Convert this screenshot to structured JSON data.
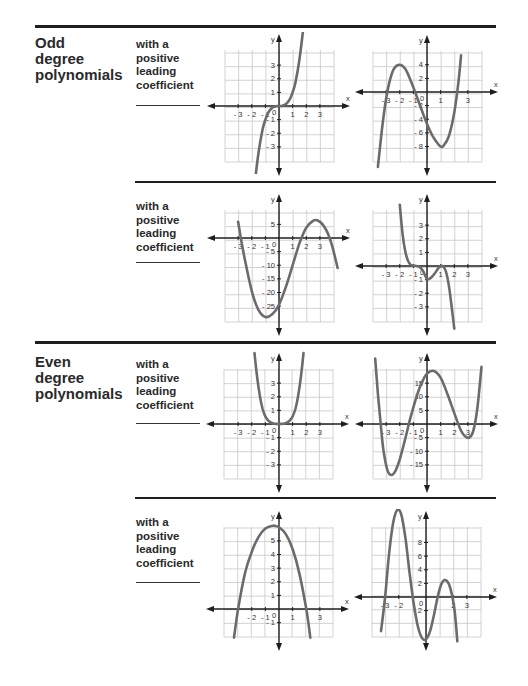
{
  "sections": [
    {
      "title_lines": [
        "Odd",
        "degree",
        "polynomials"
      ],
      "rows": [
        {
          "prompt_lines": [
            "with a",
            "positive",
            "leading",
            "coefficient"
          ],
          "answer_blank": ""
        },
        {
          "prompt_lines": [
            "with a",
            "positive",
            "leading",
            "coefficient"
          ],
          "answer_blank": ""
        }
      ]
    },
    {
      "title_lines": [
        "Even",
        "degree",
        "polynomials"
      ],
      "rows": [
        {
          "prompt_lines": [
            "with a",
            "positive",
            "leading",
            "coefficient"
          ],
          "answer_blank": ""
        },
        {
          "prompt_lines": [
            "with a",
            "positive",
            "leading",
            "coefficient"
          ],
          "answer_blank": ""
        }
      ]
    }
  ],
  "axis_labels": {
    "x": "x",
    "y": "y",
    "origin": "0"
  },
  "colors": {
    "curve": "#6b6b6b",
    "grid": "#c8c8c8",
    "axis": "#1e1e1e",
    "rule": "#1e1e1e"
  },
  "chart_data": [
    {
      "id": "odd-1",
      "type": "line",
      "section": "Odd degree polynomials",
      "title": "",
      "xlabel": "x",
      "ylabel": "y",
      "xlim": [
        -4,
        4
      ],
      "ylim": [
        -4,
        4
      ],
      "grid": true,
      "x_ticks": [
        -3,
        -2,
        -1,
        1,
        2,
        3
      ],
      "y_ticks": [
        3,
        2,
        1,
        -1,
        -2,
        -3
      ],
      "y_step": 1,
      "series": [
        {
          "name": "curve",
          "x": [
            -1.8,
            -1.5,
            -1.2,
            -1,
            -0.8,
            -0.5,
            -0.25,
            0,
            0.25,
            0.5,
            0.8,
            1,
            1.2,
            1.5,
            1.8
          ],
          "y": [
            -5.8,
            -3.4,
            -1.7,
            -1,
            -0.51,
            -0.13,
            -0.02,
            0,
            0.02,
            0.13,
            0.51,
            1,
            1.7,
            3.4,
            5.8
          ]
        }
      ]
    },
    {
      "id": "odd-2",
      "type": "line",
      "section": "Odd degree polynomials",
      "title": "",
      "xlabel": "x",
      "ylabel": "y",
      "xlim": [
        -4,
        4
      ],
      "ylim": [
        -10,
        6
      ],
      "grid": true,
      "x_ticks": [
        -3,
        -2,
        -1,
        1,
        3
      ],
      "y_ticks": [
        4,
        2,
        -2,
        -4,
        -6,
        -8
      ],
      "y_step": 2,
      "series": [
        {
          "name": "curve",
          "x": [
            -3.6,
            -3.3,
            -3,
            -2.7,
            -2.4,
            -2,
            -1.6,
            -1.2,
            -0.8,
            -0.4,
            0,
            0.4,
            0.8,
            1,
            1.2,
            1.6,
            2,
            2.3,
            2.5
          ],
          "y": [
            -11,
            -5.4,
            -1,
            1.9,
            3.5,
            4,
            3.4,
            1.7,
            -0.4,
            -2.6,
            -4.7,
            -6.4,
            -7.6,
            -8,
            -7.9,
            -6.5,
            -3,
            1.3,
            5.4
          ]
        }
      ]
    },
    {
      "id": "odd-3",
      "type": "line",
      "section": "Odd degree polynomials",
      "title": "",
      "xlabel": "x",
      "ylabel": "y",
      "xlim": [
        -4,
        4
      ],
      "ylim": [
        -32,
        8
      ],
      "grid": true,
      "x_ticks": [
        -3,
        -2,
        -1,
        1,
        2,
        3
      ],
      "y_ticks": [
        5,
        -5,
        -10,
        -15,
        -20,
        -25
      ],
      "y_step": 5,
      "series": [
        {
          "name": "curve",
          "x": [
            -3,
            -2.8,
            -2.5,
            -2,
            -1.5,
            -1,
            -0.5,
            0,
            0.5,
            1,
            1.5,
            2,
            2.5,
            2.8,
            3.2,
            3.6,
            3.9,
            4.3
          ],
          "y": [
            6,
            0,
            -8,
            -19.5,
            -26.5,
            -29,
            -28,
            -24.5,
            -18,
            -10,
            -2,
            3.8,
            6.3,
            6.5,
            5,
            1.5,
            -2.8,
            -11
          ]
        }
      ]
    },
    {
      "id": "odd-4",
      "type": "line",
      "section": "Odd degree polynomials",
      "title": "",
      "xlabel": "x",
      "ylabel": "y",
      "xlim": [
        -4,
        4
      ],
      "ylim": [
        -4,
        4
      ],
      "grid": true,
      "x_ticks": [
        -3,
        -2,
        -1,
        1,
        2,
        3
      ],
      "y_ticks": [
        3,
        2,
        1,
        -1,
        -2,
        -3
      ],
      "y_step": 1,
      "series": [
        {
          "name": "curve",
          "x": [
            -2,
            -1.8,
            -1.6,
            -1.4,
            -1.2,
            -1,
            -0.6,
            -0.3,
            0,
            0.3,
            0.6,
            0.8,
            1,
            1.2,
            1.4,
            1.6,
            1.8,
            2
          ],
          "y": [
            4.5,
            2.4,
            1.1,
            0.4,
            0.1,
            0.03,
            -0.05,
            -0.35,
            -0.95,
            -0.85,
            -0.5,
            -0.2,
            0,
            -0.05,
            -0.45,
            -1.4,
            -2.9,
            -4.6
          ]
        }
      ]
    },
    {
      "id": "even-1",
      "type": "line",
      "section": "Even degree polynomials",
      "title": "",
      "xlabel": "x",
      "ylabel": "y",
      "xlim": [
        -4,
        4
      ],
      "ylim": [
        -4,
        4
      ],
      "grid": true,
      "x_ticks": [
        -3,
        -2,
        -1,
        1,
        2,
        3
      ],
      "y_ticks": [
        3,
        2,
        1,
        -1,
        -2,
        -3
      ],
      "y_step": 1,
      "series": [
        {
          "name": "curve",
          "x": [
            -1.8,
            -1.6,
            -1.4,
            -1.2,
            -1,
            -0.8,
            -0.6,
            -0.4,
            -0.2,
            0,
            0.2,
            0.4,
            0.6,
            0.8,
            1,
            1.2,
            1.4,
            1.6,
            1.8
          ],
          "y": [
            5.2,
            3.4,
            2.05,
            1.1,
            0.55,
            0.27,
            0.12,
            0.04,
            0.01,
            0,
            0.01,
            0.04,
            0.12,
            0.27,
            0.55,
            1.1,
            2.05,
            3.4,
            5.2
          ]
        }
      ]
    },
    {
      "id": "even-2",
      "type": "line",
      "section": "Even degree polynomials",
      "title": "",
      "xlabel": "x",
      "ylabel": "y",
      "xlim": [
        -4,
        4
      ],
      "ylim": [
        -20,
        20
      ],
      "grid": true,
      "x_ticks": [
        -3,
        -2,
        -1,
        1,
        2,
        3
      ],
      "y_ticks": [
        15,
        10,
        5,
        -5,
        -10,
        -15
      ],
      "y_step": 5,
      "series": [
        {
          "name": "curve",
          "x": [
            -3.8,
            -3.6,
            -3.4,
            -3.2,
            -2.9,
            -2.6,
            -2.3,
            -2,
            -1.6,
            -1.2,
            -0.8,
            -0.4,
            0,
            0.5,
            1,
            1.5,
            2,
            2.5,
            2.8,
            3.1,
            3.4,
            3.7,
            4
          ],
          "y": [
            24,
            11,
            0,
            -9.5,
            -17,
            -18.7,
            -17,
            -13,
            -5.5,
            2.5,
            9.5,
            15,
            18.5,
            19.5,
            17,
            11,
            4,
            -2.5,
            -4.5,
            -5,
            -2.5,
            6,
            21
          ]
        }
      ]
    },
    {
      "id": "even-3",
      "type": "line",
      "section": "Even degree polynomials",
      "title": "",
      "xlabel": "x",
      "ylabel": "y",
      "xlim": [
        -4,
        4
      ],
      "ylim": [
        -2,
        6
      ],
      "grid": true,
      "x_ticks": [
        -2,
        -1,
        1,
        3
      ],
      "y_ticks": [
        5,
        4,
        3,
        2,
        1,
        -1
      ],
      "y_step": 1,
      "series": [
        {
          "name": "curve",
          "x": [
            -3.3,
            -3,
            -2.5,
            -2,
            -1.5,
            -1,
            -0.5,
            -0.3,
            0,
            0.5,
            1,
            1.5,
            2,
            2.3
          ],
          "y": [
            -2.1,
            0,
            2.6,
            4.2,
            5.3,
            5.9,
            6.1,
            6.1,
            6.0,
            5.5,
            4.4,
            2.6,
            0,
            -2.1
          ]
        }
      ]
    },
    {
      "id": "even-4",
      "type": "line",
      "section": "Even degree polynomials",
      "title": "",
      "xlabel": "x",
      "ylabel": "y",
      "xlim": [
        -4,
        4
      ],
      "ylim": [
        -6,
        10
      ],
      "grid": true,
      "x_ticks": [
        -3,
        -2,
        2,
        3
      ],
      "y_ticks": [
        8,
        6,
        4,
        2,
        -2
      ],
      "y_step": 2,
      "series": [
        {
          "name": "curve",
          "x": [
            -3.3,
            -3,
            -2.7,
            -2.4,
            -2.1,
            -1.8,
            -1.5,
            -1.2,
            -0.9,
            -0.6,
            -0.3,
            0,
            0.3,
            0.6,
            0.9,
            1.2,
            1.5,
            1.8,
            2.1,
            2.3
          ],
          "y": [
            -5,
            0,
            6.5,
            11,
            12.8,
            12,
            8.5,
            3.5,
            -1,
            -4.3,
            -6,
            -6.2,
            -5,
            -2.5,
            0.4,
            2.2,
            2.4,
            1.2,
            -2,
            -6.5
          ]
        }
      ]
    }
  ]
}
